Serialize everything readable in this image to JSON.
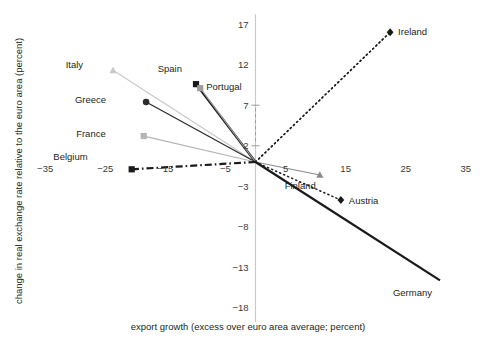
{
  "chart_data": {
    "type": "scatter",
    "title": "",
    "xlabel": "export growth (excess over euro area average; percent)",
    "ylabel": "change in real exchange rate relative to the euro area (percent)",
    "xlim": [
      -40,
      40
    ],
    "ylim": [
      -18,
      17
    ],
    "xticks": [
      -35,
      -25,
      -15,
      -5,
      5,
      15,
      25,
      35
    ],
    "yticks": [
      17,
      12,
      7,
      2,
      -3,
      -8,
      -13,
      -18
    ],
    "grid": false,
    "legend": "inline-labels",
    "origin": [
      0,
      0
    ],
    "note": "Each country is drawn as a connector line from the origin (euro area average) out to its marker.",
    "points": [
      {
        "name": "Italy",
        "x": -23.7,
        "y": 11.3,
        "marker": "triangle",
        "color": "#c9c9c9",
        "line": "solid-thin",
        "label_dx": -30,
        "label_dy": -2
      },
      {
        "name": "Spain",
        "x": -9.9,
        "y": 9.6,
        "marker": "square",
        "color": "#1a1a1a",
        "line": "solid-thick",
        "label_dx": -14,
        "label_dy": -12
      },
      {
        "name": "Portugal",
        "x": -9.2,
        "y": 9.1,
        "marker": "square",
        "color": "#9e9e9e",
        "line": "solid-thin",
        "label_dx": 6,
        "label_dy": 2
      },
      {
        "name": "Greece",
        "x": -18.2,
        "y": 7.4,
        "marker": "circle",
        "color": "#2b2b2b",
        "line": "solid-thin",
        "label_dx": -40,
        "label_dy": 1
      },
      {
        "name": "France",
        "x": -18.6,
        "y": 3.2,
        "marker": "square",
        "color": "#b5b5b5",
        "line": "solid-thin",
        "label_dx": -38,
        "label_dy": 1
      },
      {
        "name": "Belgium",
        "x": -20.6,
        "y": -0.9,
        "marker": "square",
        "color": "#1a1a1a",
        "line": "dash-dot",
        "label_dx": -44,
        "label_dy": -9
      },
      {
        "name": "Netherlands",
        "x": 22.4,
        "y": 16.0,
        "marker": "none",
        "color": "#4a4a4a",
        "line": "dotted",
        "label_dx": 6,
        "label_dy": -62
      },
      {
        "name": "Ireland",
        "x": 22.4,
        "y": 16.0,
        "marker": "diamond",
        "color": "#1a1a1a",
        "line": "dotted",
        "label_dx": 8,
        "label_dy": 3
      },
      {
        "name": "Finland",
        "x": 10.7,
        "y": -1.6,
        "marker": "triangle",
        "color": "#8a8a8a",
        "line": "solid-thin",
        "label_dx": -4,
        "label_dy": 14
      },
      {
        "name": "Austria",
        "x": 14.2,
        "y": -4.7,
        "marker": "diamond",
        "color": "#1a1a1a",
        "line": "dotted",
        "label_dx": 8,
        "label_dy": 4
      },
      {
        "name": "Germany",
        "x": 30.7,
        "y": -14.6,
        "marker": "none",
        "color": "#1a1a1a",
        "line": "solid-thick",
        "label_dx": -8,
        "label_dy": 16
      }
    ]
  },
  "axes": {
    "x_title": "export growth (excess over euro area average; percent)",
    "y_title": "change in real exchange rate relative to the euro area (percent)",
    "x_tick_labels": [
      "−35",
      "−25",
      "−15",
      "−5",
      "5",
      "15",
      "25",
      "35"
    ],
    "y_tick_labels": [
      "17",
      "12",
      "7",
      "2",
      "−3",
      "−8",
      "−13",
      "−18"
    ]
  },
  "colors": {
    "text": "#231f20",
    "axis": "#c8c8c8",
    "dark_series": "#1a1a1a",
    "mid_series": "#8a8a8a",
    "light_series": "#c9c9c9"
  }
}
